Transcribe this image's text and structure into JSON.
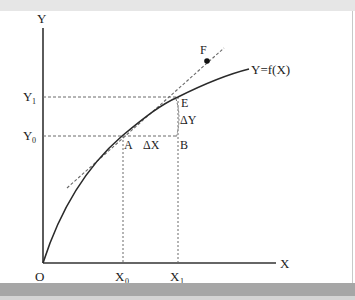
{
  "figure": {
    "type": "derivative-tangent-diagram",
    "colors": {
      "axis": "#333333",
      "curve": "#2a2a2a",
      "dashed": "#6a6a6a",
      "point": "#111111",
      "top_band": "#e6e6e6",
      "bottom_band": "#a6a6a6"
    },
    "labels": {
      "y_axis": "Y",
      "x_axis": "X",
      "origin": "O",
      "curve": "Y=f(X)",
      "y1_main": "Y",
      "y1_sub": "1",
      "y0_main": "Y",
      "y0_sub": "0",
      "x0_main": "X",
      "x0_sub": "0",
      "x1_main": "X",
      "x1_sub": "1",
      "point_a": "A",
      "point_b": "B",
      "point_e": "E",
      "point_f": "F",
      "delta_x": "ΔX",
      "delta_y": "ΔY"
    },
    "points": {
      "origin": [
        43,
        263
      ],
      "A": [
        122,
        136
      ],
      "B": [
        178,
        136
      ],
      "E": [
        178,
        97
      ],
      "F": [
        207,
        61
      ]
    }
  }
}
